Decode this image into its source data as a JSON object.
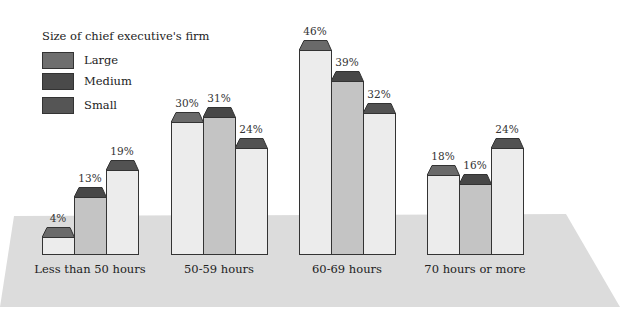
{
  "chart_data": {
    "type": "bar",
    "title": "",
    "legend_title": "Size of chief executive's firm",
    "categories": [
      "Less than 50 hours",
      "50-59 hours",
      "60-69 hours",
      "70 hours or more"
    ],
    "series": [
      {
        "name": "Large",
        "values": [
          4,
          30,
          46,
          18
        ],
        "labels": [
          "4%",
          "30%",
          "46%",
          "18%"
        ]
      },
      {
        "name": "Medium",
        "values": [
          13,
          31,
          39,
          16
        ],
        "labels": [
          "13%",
          "31%",
          "39%",
          "16%"
        ]
      },
      {
        "name": "Small",
        "values": [
          19,
          24,
          32,
          24
        ],
        "labels": [
          "19%",
          "24%",
          "32%",
          "24%"
        ]
      }
    ],
    "xlabel": "",
    "ylabel": "",
    "ylim": [
      0,
      50
    ],
    "grid": false,
    "legend_position": "top-left",
    "style": "3d-perspective bars with dark caps on grey floor"
  },
  "legend": {
    "title": "Size of chief executive's firm",
    "items": [
      {
        "label": "Large",
        "color": "#6e6e6e"
      },
      {
        "label": "Medium",
        "color": "#4a4a4a"
      },
      {
        "label": "Small",
        "color": "#555555"
      }
    ]
  },
  "colors": {
    "bar_face_light": "#ececec",
    "bar_face_medium": "#c4c4c4",
    "cap_large": "#6a6a6a",
    "cap_medium": "#474747",
    "cap_small": "#525252",
    "floor": "#dcdcdc"
  }
}
